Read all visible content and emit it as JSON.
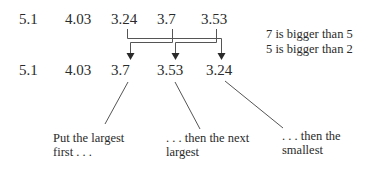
{
  "diagram": {
    "original_row": [
      "5.1",
      "4.03",
      "3.24",
      "3.7",
      "3.53"
    ],
    "sorted_row": [
      "5.1",
      "4.03",
      "3.7",
      "3.53",
      "3.24"
    ],
    "notes": [
      "7 is bigger than 5",
      "5 is bigger than 2"
    ],
    "captions": [
      {
        "line1": "Put the largest",
        "line2": "first . . ."
      },
      {
        "line1": ". . . then the next",
        "line2": "largest"
      },
      {
        "line1": ". . . then the",
        "line2": "smallest"
      }
    ],
    "line_color": "#555555"
  }
}
